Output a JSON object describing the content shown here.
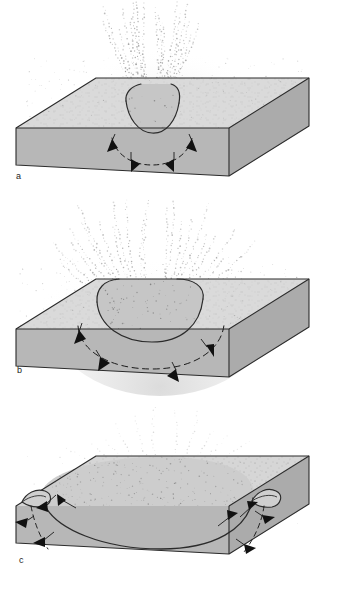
{
  "figure": {
    "domain": "scientific-diagram",
    "panel_count": 3,
    "background_color": "#ffffff",
    "palette": {
      "top_surface": "#d9d9d9",
      "front_face": "#b6b6b6",
      "side_face": "#aeaeae",
      "crater_interior": "#c9c9c9",
      "outline": "#2b2b2b",
      "arrow_fill": "#111111",
      "ejecta_dot": "#6e6e6e",
      "speckle": "#8a8a8a",
      "label_color": "#1c1c1c"
    }
  },
  "panels": [
    {
      "id": "a",
      "label": "a",
      "caption": "",
      "stage": "early excavation",
      "crater": {
        "shape": "narrow-u",
        "relative_width": 0.22,
        "relative_depth": 0.3,
        "rim": "none"
      },
      "ejecta": {
        "pattern": "narrow-vertical-plume",
        "streak_count": 17,
        "spread_degrees": 54,
        "height_fraction": 0.72,
        "density": "high"
      },
      "shock_front": {
        "style": "dashed-arc",
        "arrow_count": 4,
        "direction": "radially-outward-downward"
      }
    },
    {
      "id": "b",
      "label": "b",
      "caption": "",
      "stage": "crater growth",
      "crater": {
        "shape": "broad-bowl",
        "relative_width": 0.52,
        "relative_depth": 0.34,
        "rim": "slight"
      },
      "ejecta": {
        "pattern": "wide-fan-plume",
        "streak_count": 23,
        "spread_degrees": 104,
        "height_fraction": 0.8,
        "density": "medium-high"
      },
      "shock_front": {
        "style": "dashed-arc",
        "arrow_count": 4,
        "direction": "radially-outward-downward"
      }
    },
    {
      "id": "c",
      "label": "c",
      "caption": "",
      "stage": "final excavation and rim overturn",
      "crater": {
        "shape": "wide-shallow-bowl",
        "relative_width": 0.86,
        "relative_depth": 0.18,
        "rim": "overturned-flap"
      },
      "ejecta": {
        "pattern": "low-diffuse-curtain",
        "streak_count": 14,
        "spread_degrees": 132,
        "height_fraction": 0.38,
        "density": "low"
      },
      "shock_front": {
        "style": "dashed-arc-pair",
        "arrow_count": 6,
        "direction": "outward-and-upward-at-rim"
      }
    }
  ]
}
